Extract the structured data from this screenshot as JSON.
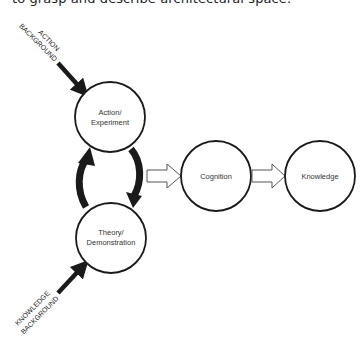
{
  "caption_fragment": "to grasp and describe architectural space.",
  "nodes": [
    {
      "id": "action",
      "line1": "Action/",
      "line2": "Experiment"
    },
    {
      "id": "theory",
      "line1": "Theory/",
      "line2": "Demonstration"
    },
    {
      "id": "cognition",
      "label": "Cognition"
    },
    {
      "id": "knowledge",
      "label": "Knowledge"
    }
  ],
  "inputs": {
    "action_background": {
      "line1": "ACTION",
      "line2": "BACKGROUND"
    },
    "knowledge_background": {
      "line1": "KNOWLEDGE",
      "line2": "BACKGROUND"
    }
  },
  "colors": {
    "stroke": "#1a1a1a",
    "background": "#ffffff"
  }
}
